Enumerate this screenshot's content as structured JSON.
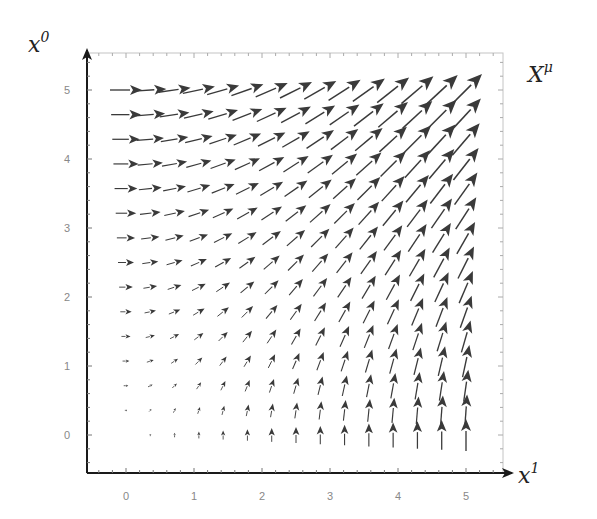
{
  "chart_data": {
    "type": "quiver",
    "title": "",
    "field_label": "X",
    "field_label_sup": "μ",
    "xlabel": "x",
    "xlabel_sup": "1",
    "ylabel": "x",
    "ylabel_sup": "0",
    "x_ticks": [
      "0",
      "1",
      "2",
      "3",
      "4",
      "5"
    ],
    "y_ticks": [
      "0",
      "1",
      "2",
      "3",
      "4",
      "5"
    ],
    "xlim": [
      -0.55,
      5.55
    ],
    "ylim": [
      -0.55,
      5.55
    ],
    "grid": false,
    "vector_field": {
      "description": "X^mu = (x^0, x^1): horizontal component = x^0, vertical component = x^1",
      "u": "x0",
      "v": "x1",
      "sample_x": {
        "start": 0,
        "stop": 5,
        "count": 15
      },
      "sample_y": {
        "start": 0,
        "stop": 5,
        "count": 15
      }
    },
    "arrow_color": "#3a3a3a",
    "axis_color": "#1a1a1a",
    "frame_color": "#bbbbbb"
  }
}
